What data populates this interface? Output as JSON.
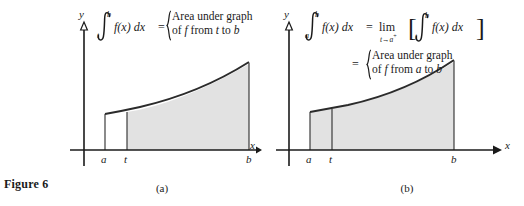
{
  "figure": {
    "caption": "Figure 6"
  },
  "panels": [
    {
      "id": "a",
      "label": "(a)",
      "axis": {
        "y_label": "y",
        "x_label": "x"
      },
      "tick_labels": [
        "a",
        "t",
        "b"
      ],
      "equation": {
        "integral_lower": "t",
        "integral_upper": "b",
        "integrand": "f(x) dx",
        "equals": "=",
        "brace_line1": "Area under graph",
        "brace_line2_prefix": "of",
        "brace_line2_f": "f",
        "brace_line2_mid": "from",
        "brace_line2_from": "t",
        "brace_line2_to_word": "to",
        "brace_line2_to": "b"
      },
      "shaded_from": "t",
      "shaded_to": "b"
    },
    {
      "id": "b",
      "label": "(b)",
      "axis": {
        "y_label": "y",
        "x_label": "x"
      },
      "tick_labels": [
        "a",
        "t",
        "b"
      ],
      "equation": {
        "integral_lower": "a",
        "integral_upper": "b",
        "integrand": "f(x) dx",
        "equals": "=",
        "limit_op": "lim",
        "limit_sub": "t→a",
        "limit_sub_sign": "+",
        "bracket_open": "[",
        "bracket_close": "]",
        "inner_integral_lower": "t",
        "inner_integral_upper": "b",
        "inner_integrand": "f(x) dx",
        "equals2": "=",
        "brace_line1": "Area under graph",
        "brace_line2_prefix": "of",
        "brace_line2_f": "f",
        "brace_line2_mid": "from",
        "brace_line2_from": "a",
        "brace_line2_to_word": "to",
        "brace_line2_to": "b"
      },
      "shaded_from": "a",
      "shaded_to": "b"
    }
  ],
  "style": {
    "shade_color": "#e2e2e2",
    "curve_color": "#2b2b2b",
    "axis_color": "#1a1a1a",
    "text_color": "#1a1a1a"
  }
}
